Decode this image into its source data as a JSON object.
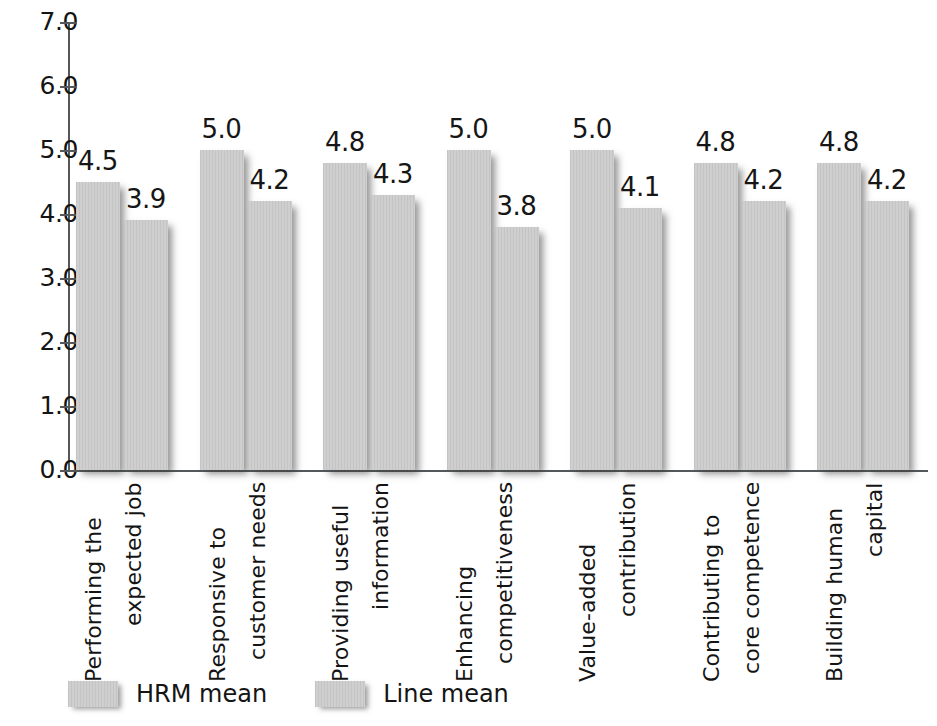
{
  "chart_data": {
    "type": "bar",
    "title": "",
    "subtitle": "",
    "xlabel": "",
    "ylabel": "",
    "ylim": [
      0.0,
      7.0
    ],
    "ytick_labels": [
      "7.0",
      "6.0",
      "5.0",
      "4.0",
      "3.0",
      "2.0",
      "1.0",
      "0.0"
    ],
    "ytick_values": [
      7.0,
      6.0,
      5.0,
      4.0,
      3.0,
      2.0,
      1.0,
      0.0
    ],
    "grid": false,
    "legend_position": "bottom-left",
    "categories": [
      "Performing the expected job",
      "Responsive to customer needs",
      "Providing useful information",
      "Enhancing competitiveness",
      "Value-added contribution",
      "Contributing to core competence",
      "Building human capital"
    ],
    "category_lines": [
      [
        "Performing the",
        "expected job"
      ],
      [
        "Responsive to",
        "customer needs"
      ],
      [
        "Providing useful",
        "information"
      ],
      [
        "Enhancing",
        "competitiveness"
      ],
      [
        "Value-added",
        "contribution"
      ],
      [
        "Contributing to",
        "core competence"
      ],
      [
        "Building human",
        "capital"
      ]
    ],
    "series": [
      {
        "name": "HRM mean",
        "values": [
          4.5,
          5.0,
          4.8,
          5.0,
          5.0,
          4.8,
          4.8
        ],
        "labels": [
          "4.5",
          "5.0",
          "4.8",
          "5.0",
          "5.0",
          "4.8",
          "4.8"
        ],
        "color": "#c9c9c9"
      },
      {
        "name": "Line mean",
        "values": [
          3.9,
          4.2,
          4.3,
          3.8,
          4.1,
          4.2,
          4.2
        ],
        "labels": [
          "3.9",
          "4.2",
          "4.3",
          "3.8",
          "4.1",
          "4.2",
          "4.2"
        ],
        "color": "#c9c9c9"
      }
    ]
  },
  "legend": {
    "items": [
      {
        "label": "HRM mean"
      },
      {
        "label": "Line mean"
      }
    ]
  }
}
